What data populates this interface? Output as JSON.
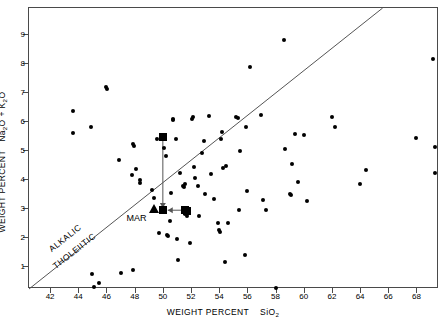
{
  "figure": {
    "domain": "geochemistry-alkali-silica-diagram",
    "background_color": "#ffffff",
    "frame_color": "#4a4a4a",
    "marker_color": "#000000"
  },
  "axes": {
    "x": {
      "title_prefix": "WEIGHT PERCENT",
      "title_species": "SiO",
      "title_subscript": "2",
      "ticks": [
        42,
        44,
        46,
        48,
        50,
        52,
        54,
        56,
        58,
        60,
        62,
        64,
        66,
        68
      ],
      "tick_labels": [
        "42",
        "44",
        "46",
        "48",
        "50",
        "52",
        "54",
        "56",
        "58",
        "60",
        "62",
        "64",
        "66",
        "68"
      ],
      "range": [
        40.5,
        69.6
      ]
    },
    "y": {
      "title_prefix": "WEIGHT PERCENT",
      "title_species_1": "Na",
      "title_sub_1": "2",
      "title_species_1b": "O",
      "title_plus": "+",
      "title_species_2": "K",
      "title_sub_2": "2",
      "title_species_2b": "O",
      "ticks": [
        1,
        2,
        3,
        4,
        5,
        6,
        7,
        8,
        9
      ],
      "tick_labels": [
        "1",
        "2",
        "3",
        "4",
        "5",
        "6",
        "7",
        "8",
        "9"
      ],
      "range": [
        0.2,
        9.9
      ]
    }
  },
  "annotations": {
    "field_upper": "ALKALIC",
    "field_lower": "THOLEIITIC",
    "mar_label": "MAR"
  },
  "chart_data": {
    "type": "scatter",
    "title": "",
    "xlabel": "WEIGHT PERCENT SiO2",
    "ylabel": "WEIGHT PERCENT Na2O + K2O",
    "xlim": [
      40.5,
      69.6
    ],
    "ylim": [
      0.2,
      9.9
    ],
    "grid": false,
    "legend": null,
    "divider_line": {
      "label_above": "ALKALIC",
      "label_below": "THOLEIITIC",
      "x": [
        40.5,
        65.6
      ],
      "y": [
        0.2,
        9.9
      ],
      "description": "Macdonald-Katsura alkalic/tholeiitic dividing line"
    },
    "series": [
      {
        "name": "analyses",
        "marker": "circle",
        "points": [
          [
            43.6,
            6.33
          ],
          [
            43.6,
            5.58
          ],
          [
            45.0,
            0.72
          ],
          [
            45.1,
            0.28
          ],
          [
            45.5,
            0.42
          ],
          [
            44.9,
            5.79
          ],
          [
            46.0,
            7.17
          ],
          [
            46.05,
            7.12
          ],
          [
            46.9,
            4.64
          ],
          [
            47.0,
            0.75
          ],
          [
            47.9,
            0.86
          ],
          [
            47.8,
            4.12
          ],
          [
            47.85,
            5.22
          ],
          [
            47.95,
            5.12
          ],
          [
            48.1,
            4.35
          ],
          [
            48.35,
            3.95
          ],
          [
            48.4,
            3.85
          ],
          [
            49.2,
            3.62
          ],
          [
            49.35,
            3.33
          ],
          [
            49.6,
            5.38
          ],
          [
            49.7,
            2.15
          ],
          [
            50.0,
            5.45
          ],
          [
            50.05,
            5.42
          ],
          [
            50.1,
            5.08
          ],
          [
            50.2,
            4.78
          ],
          [
            50.3,
            2.08
          ],
          [
            50.35,
            2.02
          ],
          [
            50.5,
            2.55
          ],
          [
            50.6,
            3.52
          ],
          [
            50.7,
            6.02
          ],
          [
            50.75,
            6.06
          ],
          [
            50.9,
            5.38
          ],
          [
            51.0,
            1.92
          ],
          [
            51.1,
            1.2
          ],
          [
            51.25,
            4.22
          ],
          [
            51.4,
            3.75
          ],
          [
            51.5,
            3.72
          ],
          [
            51.6,
            3.82
          ],
          [
            51.55,
            2.78
          ],
          [
            51.7,
            2.72
          ],
          [
            51.9,
            1.8
          ],
          [
            52.1,
            6.08
          ],
          [
            52.15,
            6.15
          ],
          [
            52.2,
            4.42
          ],
          [
            52.3,
            4.04
          ],
          [
            52.5,
            3.75
          ],
          [
            52.6,
            2.72
          ],
          [
            52.8,
            4.88
          ],
          [
            52.9,
            5.3
          ],
          [
            53.0,
            3.48
          ],
          [
            53.3,
            6.17
          ],
          [
            53.4,
            4.18
          ],
          [
            53.6,
            3.32
          ],
          [
            53.9,
            2.48
          ],
          [
            54.0,
            2.22
          ],
          [
            54.05,
            2.18
          ],
          [
            54.1,
            5.38
          ],
          [
            54.2,
            5.62
          ],
          [
            54.25,
            4.38
          ],
          [
            54.4,
            1.12
          ],
          [
            54.5,
            4.45
          ],
          [
            54.6,
            2.48
          ],
          [
            55.2,
            6.15
          ],
          [
            55.3,
            6.12
          ],
          [
            55.4,
            2.92
          ],
          [
            55.5,
            4.95
          ],
          [
            55.8,
            1.38
          ],
          [
            55.9,
            5.78
          ],
          [
            56.0,
            3.58
          ],
          [
            56.2,
            7.85
          ],
          [
            57.0,
            6.22
          ],
          [
            57.1,
            3.28
          ],
          [
            57.3,
            2.92
          ],
          [
            58.0,
            0.22
          ],
          [
            58.6,
            8.8
          ],
          [
            58.7,
            5.05
          ],
          [
            59.0,
            3.48
          ],
          [
            59.1,
            3.45
          ],
          [
            59.2,
            4.52
          ],
          [
            59.4,
            5.55
          ],
          [
            59.6,
            3.9
          ],
          [
            60.0,
            5.52
          ],
          [
            60.2,
            3.25
          ],
          [
            62.0,
            6.15
          ],
          [
            62.2,
            5.78
          ],
          [
            64.0,
            3.82
          ],
          [
            64.4,
            4.3
          ],
          [
            68.0,
            5.42
          ],
          [
            69.2,
            8.15
          ],
          [
            69.3,
            5.1
          ],
          [
            69.35,
            4.2
          ]
        ]
      },
      {
        "name": "MAR reference markers",
        "marker": "square",
        "points": [
          [
            50.0,
            5.45
          ],
          [
            50.0,
            2.92
          ],
          [
            51.6,
            2.92
          ],
          [
            51.7,
            2.88
          ]
        ]
      },
      {
        "name": "MAR reference marker",
        "marker": "triangle",
        "points": [
          [
            49.4,
            2.95
          ]
        ]
      }
    ],
    "connectors": [
      {
        "from": [
          50.0,
          5.42
        ],
        "to": [
          50.0,
          3.0
        ],
        "arrow": true,
        "direction": "down"
      },
      {
        "from": [
          51.5,
          2.92
        ],
        "to": [
          50.35,
          2.92
        ],
        "arrow": true,
        "direction": "left"
      }
    ]
  }
}
